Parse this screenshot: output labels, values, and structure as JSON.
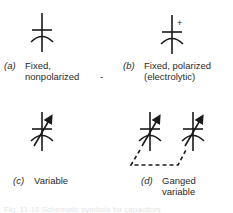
{
  "figure": {
    "symbols": [
      {
        "id": "a",
        "tag": "(a)",
        "line1": "Fixed,",
        "line2": "nonpolarized",
        "icon": "capacitor-fixed-icon"
      },
      {
        "id": "b",
        "tag": "(b)",
        "line1": "Fixed, polarized",
        "line2": "(electrolytic)",
        "icon": "capacitor-polarized-icon",
        "polarity_mark": "+"
      },
      {
        "id": "c",
        "tag": "(c)",
        "line1": "Variable",
        "line2": "",
        "icon": "capacitor-variable-icon"
      },
      {
        "id": "d",
        "tag": "(d)",
        "line1": "Ganged",
        "line2": "variable",
        "icon": "capacitor-ganged-variable-icon"
      }
    ],
    "stray_mark": "-",
    "bottom_bleed_text": "Fig. 11-16  Schematic symbols for capacitors"
  },
  "colors": {
    "ink": "#1a1a1a",
    "text": "#2a2a2a",
    "background": "#ffffff"
  }
}
